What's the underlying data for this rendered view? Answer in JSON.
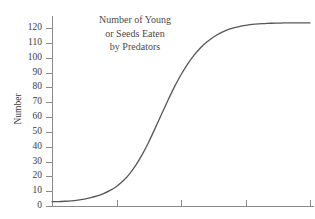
{
  "chart_data": {
    "type": "line",
    "title": "Number of Young or Seeds Eaten by Predators",
    "title_lines": [
      "Number of Young",
      "or Seeds Eaten",
      "by Predators"
    ],
    "xlabel": "",
    "ylabel": "Number",
    "ylim": [
      0,
      128
    ],
    "xlim": [
      0,
      10
    ],
    "grid": false,
    "legend": false,
    "legend_position": "none",
    "y_ticks": [
      0,
      10,
      20,
      30,
      40,
      50,
      60,
      70,
      80,
      90,
      100,
      110,
      120
    ],
    "y_tick_labels": [
      "0",
      "10",
      "20",
      "30",
      "40",
      "50",
      "60",
      "70",
      "80",
      "90",
      "100",
      "110",
      "120"
    ],
    "x_ticks": [
      0,
      2.5,
      5,
      7.5,
      10
    ],
    "x_tick_labels": [
      "",
      "",
      "",
      "",
      ""
    ],
    "series": [
      {
        "name": "Number of young or seeds eaten by predators",
        "color": "#565656",
        "x": [
          0.0,
          0.25,
          0.5,
          0.75,
          1.0,
          1.25,
          1.5,
          1.75,
          2.0,
          2.25,
          2.5,
          2.75,
          3.0,
          3.25,
          3.5,
          3.75,
          4.0,
          4.25,
          4.5,
          4.75,
          5.0,
          5.25,
          5.5,
          5.75,
          6.0,
          6.25,
          6.5,
          6.75,
          7.0,
          7.25,
          7.5,
          7.75,
          8.0,
          8.25,
          8.5,
          8.75,
          9.0,
          9.25,
          9.5,
          9.75,
          10.0
        ],
        "values": [
          3.0,
          3.0,
          3.2,
          3.5,
          4.0,
          4.7,
          5.6,
          6.8,
          8.4,
          10.5,
          13.2,
          16.8,
          21.5,
          27.5,
          34.8,
          43.2,
          52.5,
          62.0,
          71.5,
          80.5,
          88.5,
          95.5,
          101.5,
          106.5,
          110.5,
          113.8,
          116.4,
          118.4,
          119.9,
          121.0,
          121.8,
          122.4,
          122.8,
          123.0,
          123.2,
          123.3,
          123.4,
          123.4,
          123.5,
          123.5,
          123.5
        ]
      }
    ],
    "shape": "sigmoid",
    "colors": {
      "curve": "#565656",
      "axis": "#8a8a8a",
      "text": "#3b3b3b",
      "title_text": "#4a4a4a",
      "background": "#ffffff"
    }
  }
}
